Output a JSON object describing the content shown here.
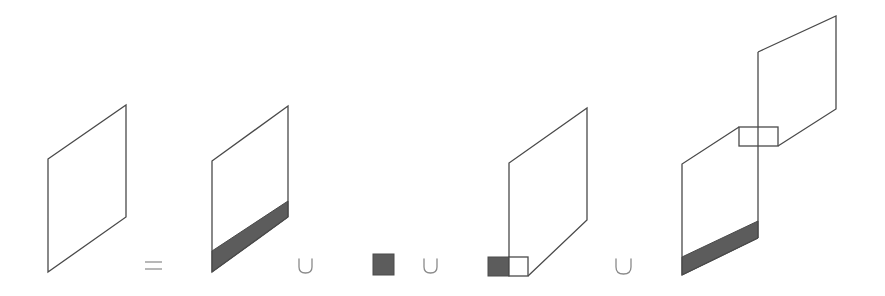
{
  "diagram": {
    "operators": [
      "=",
      "∪",
      "∪",
      "∪"
    ],
    "colors": {
      "stroke": "#4a4a4a",
      "shade": "#5c5c5c",
      "operator": "#8a8a8a",
      "background": "#ffffff"
    },
    "terms": [
      {
        "id": "whole",
        "label": "parallelogram"
      },
      {
        "id": "term1",
        "label": "parallelogram with shaded bottom band"
      },
      {
        "id": "term2",
        "label": "shaded square"
      },
      {
        "id": "term3",
        "label": "parallelogram with half-shaded rectangle at bottom-left"
      },
      {
        "id": "term4",
        "label": "two offset parallelograms joined by rectangle, lower with shaded band"
      }
    ]
  }
}
